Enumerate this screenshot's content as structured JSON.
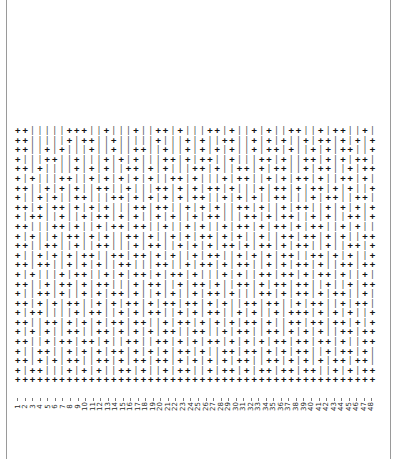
{
  "page": {
    "background_color": "#ffffff",
    "frame_color": "#9a9a9a"
  },
  "chart_data": {
    "type": "heatmap",
    "title": "",
    "subtitle": "",
    "xlabel": "",
    "ylabel": "",
    "grid": false,
    "legend": "none",
    "n_columns": 48,
    "n_rows": 27,
    "glyphs": {
      "plus": "+",
      "bar": "|"
    },
    "colors": {
      "plus": "#121212",
      "bar": "#555555"
    },
    "xlim": [
      1,
      48
    ],
    "categories": [
      "1",
      "2",
      "3",
      "4",
      "5",
      "6",
      "7",
      "8",
      "9",
      "10",
      "11",
      "12",
      "13",
      "14",
      "15",
      "16",
      "17",
      "18",
      "19",
      "20",
      "21",
      "22",
      "23",
      "24",
      "25",
      "26",
      "27",
      "28",
      "29",
      "30",
      "31",
      "32",
      "33",
      "34",
      "35",
      "36",
      "37",
      "38",
      "39",
      "40",
      "41",
      "42",
      "43",
      "44",
      "45",
      "46",
      "47",
      "48"
    ],
    "rows": [
      "++|||||+++||+|||+||++|+|||++|+||+|+||++||+|++||+|",
      "++|||||+|++||+|||||+|||+|+||++||+|+|+||+|++|+|+|+",
      "++||+|+|||+||+||++||+||+|+|+|+||+|++|+||+|+|++||+",
      "+|||++||+|||+|+|+|||++|+|++||+|||++|+||++|+|+|++|",
      "++|+||||+|+|+||++|+|+|||++|+||++|+|++||+|++||+|++",
      "+|+|||++||+|+|+|+|+||++|+|||+|++||+|+|++|+||++|+|",
      "++||+|+|+||++||+|||++|+|+|++|+|||+|++|+|++|+|+||+",
      "+||+|+||++|||++|+|+|+|+|++||+|+|+||++|||+|++||++|",
      "++|+|++|+|+|+|||++|++||+|+|+||++|+||+|++||+|+|+|+",
      "+|++||+||+|++|+|+||+|+||+|++|||++|+|++||+|+||++|+",
      "++|||++|+||+|++|++||+||+|+||+|++|+|++|+|++||+|+||",
      "+|+||+|++|+|+||++|+||+|+|++|+|+||+||++|++|+|+||++",
      "++||++||+||++|||+|++||+|+|+|++|+|++|+|++||+||++|+",
      "+||+|+|+|++||++|++|+|+||+|++||+|+|+|++||++|+|+||+",
      "++|++||+|+|+||++|||++||+|++|+|++||+|+|++|+||++|++",
      "+|+|||+|++||+|+|++|+|++|+|||+|+||++|++|+|++|+||+|",
      "++||+|++|+|++|||+|++||+|++|+||++|+|++|++||+||+|++",
      "+||++|+||+|+|++|+||+|+||+|++|+|||++|+|++|+|++||+|",
      "++|+|+|++||+|+|++|+|++|++|+|+||++|++||+|++||+|++|",
      "+|++||||+|++||+|+|++||+|+|++||+|+||+|+++|+|+|+||+",
      "++||++|+|+|+|++|++||+|++|+|+|+|++|+||++|++|++|+|+",
      "+|+|+||++||++|+|+|+|++||++||+|++||++|+|+|+||++|++",
      "++||+|++|++|+||++||++|+|+|++|+|+|+|++|++|++|+||++",
      "+||++||+|+|+|++|+|+|+|++|+||++|++|+|+|++||+|++|+|",
      "++|+|+|++||++|+|++|++|+|+|+|+|++||++|+|+|+|++|++|",
      "+|++|||+|+|+||++|+||+|++||+|++|+|++|++|++||+|+|++",
      "+++++++++++++++++++++++++++++++++++++++++++++++++"
    ]
  }
}
